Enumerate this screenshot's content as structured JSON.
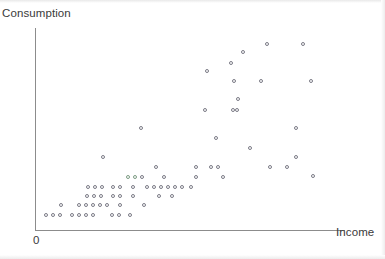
{
  "chart_data": {
    "type": "scatter",
    "title": "",
    "xlabel": "Income",
    "ylabel": "Consumption",
    "origin_label": "0",
    "grid": false,
    "legend": null,
    "axes": {
      "x_axis_shown": true,
      "y_axis_shown": true,
      "x_ticks": [],
      "y_ticks": [],
      "arrowheads": false,
      "note": "Unlabeled schematic axes; only the origin is marked 0"
    },
    "marker": {
      "shape": "open-circle",
      "size_px": 4,
      "fill": "none",
      "stroke": "#7b7b86",
      "tinted_stroke": "#7d9c84"
    },
    "relationship": "positive, fan-shaped (increasing variance) association between income and consumption",
    "n_points": 97,
    "points": [
      {
        "x": 46,
        "y": 215
      },
      {
        "x": 53,
        "y": 215
      },
      {
        "x": 60,
        "y": 215
      },
      {
        "x": 72,
        "y": 215
      },
      {
        "x": 79,
        "y": 215
      },
      {
        "x": 86,
        "y": 215
      },
      {
        "x": 93,
        "y": 215
      },
      {
        "x": 112,
        "y": 215
      },
      {
        "x": 119,
        "y": 215
      },
      {
        "x": 130,
        "y": 215
      },
      {
        "x": 61,
        "y": 205
      },
      {
        "x": 79,
        "y": 205
      },
      {
        "x": 86,
        "y": 205
      },
      {
        "x": 93,
        "y": 205
      },
      {
        "x": 100,
        "y": 205
      },
      {
        "x": 107,
        "y": 205
      },
      {
        "x": 120,
        "y": 205
      },
      {
        "x": 144,
        "y": 205
      },
      {
        "x": 87,
        "y": 196
      },
      {
        "x": 94,
        "y": 196
      },
      {
        "x": 101,
        "y": 196
      },
      {
        "x": 113,
        "y": 196
      },
      {
        "x": 120,
        "y": 196
      },
      {
        "x": 133,
        "y": 196
      },
      {
        "x": 159,
        "y": 196
      },
      {
        "x": 172,
        "y": 196
      },
      {
        "x": 88,
        "y": 187
      },
      {
        "x": 95,
        "y": 187
      },
      {
        "x": 102,
        "y": 187
      },
      {
        "x": 113,
        "y": 187
      },
      {
        "x": 120,
        "y": 187
      },
      {
        "x": 133,
        "y": 187
      },
      {
        "x": 147,
        "y": 187
      },
      {
        "x": 154,
        "y": 187
      },
      {
        "x": 161,
        "y": 187
      },
      {
        "x": 168,
        "y": 187
      },
      {
        "x": 175,
        "y": 187
      },
      {
        "x": 182,
        "y": 187
      },
      {
        "x": 191,
        "y": 187
      },
      {
        "x": 128,
        "y": 177,
        "tint": true
      },
      {
        "x": 135,
        "y": 177,
        "tint": true
      },
      {
        "x": 142,
        "y": 177
      },
      {
        "x": 164,
        "y": 177
      },
      {
        "x": 196,
        "y": 177
      },
      {
        "x": 223,
        "y": 177
      },
      {
        "x": 156,
        "y": 167
      },
      {
        "x": 196,
        "y": 167
      },
      {
        "x": 211,
        "y": 167
      },
      {
        "x": 218,
        "y": 167
      },
      {
        "x": 103,
        "y": 157
      },
      {
        "x": 270,
        "y": 167
      },
      {
        "x": 287,
        "y": 167
      },
      {
        "x": 296,
        "y": 157
      },
      {
        "x": 141,
        "y": 128
      },
      {
        "x": 216,
        "y": 138
      },
      {
        "x": 250,
        "y": 148
      },
      {
        "x": 296,
        "y": 128
      },
      {
        "x": 205,
        "y": 110
      },
      {
        "x": 237,
        "y": 110
      },
      {
        "x": 233,
        "y": 110
      },
      {
        "x": 207,
        "y": 71
      },
      {
        "x": 231,
        "y": 63
      },
      {
        "x": 243,
        "y": 52
      },
      {
        "x": 267,
        "y": 44
      },
      {
        "x": 303,
        "y": 44
      },
      {
        "x": 234,
        "y": 81
      },
      {
        "x": 261,
        "y": 81
      },
      {
        "x": 311,
        "y": 81
      },
      {
        "x": 238,
        "y": 99
      },
      {
        "x": 313,
        "y": 176
      }
    ],
    "point_rows_description": [
      "Bottom band (y~215): 10 markers spanning low income",
      "Second band (y~205): 8 markers",
      "Third band (y~196): 8 markers",
      "Fourth band (y~187): 13 markers, widest low-income row",
      "Mid band (y~177): 6 markers incl. 2 green-tinted near x=128-135",
      "Upper scatter: sparse markers fanning to upper right"
    ]
  },
  "labels": {
    "y_axis_title": "Consumption",
    "x_axis_title": "Income",
    "origin": "0"
  }
}
